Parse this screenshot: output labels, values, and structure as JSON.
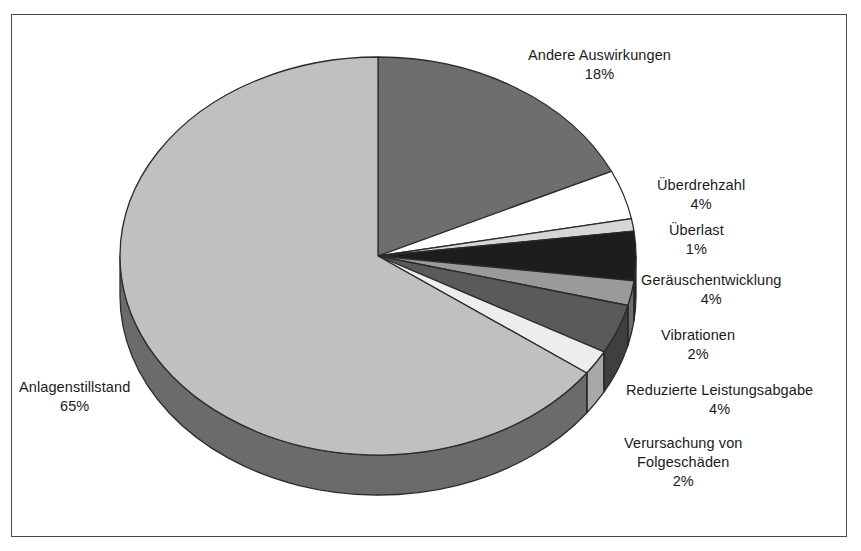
{
  "chart_data": {
    "type": "pie",
    "title": "",
    "subtitle": "",
    "xlabel": "",
    "ylabel": "",
    "legend_position": "callout-labels",
    "grid": false,
    "units": "%",
    "start_angle_deg": 0,
    "direction": "clockwise",
    "total": 100,
    "categories": [
      "Andere Auswirkungen",
      "Überdrehzahl",
      "Überlast",
      "Geräuschentwicklung",
      "Vibrationen",
      "Reduzierte Leistungsabgabe",
      "Verursachung von Folgeschäden",
      "Anlagenstillstand"
    ],
    "values": [
      18,
      4,
      1,
      4,
      2,
      4,
      2,
      65
    ],
    "labels": [
      "18%",
      "4%",
      "1%",
      "4%",
      "2%",
      "4%",
      "2%",
      "65%"
    ],
    "colors": [
      "#6e6e6e",
      "#ffffff",
      "#d6d6d6",
      "#1d1d1d",
      "#9a9a9a",
      "#5a5a5a",
      "#ededed",
      "#c0c0c0"
    ],
    "side_colors": [
      "#4d4d4d",
      "#b5b5b5",
      "#9a9a9a",
      "#121212",
      "#6e6e6e",
      "#3f3f3f",
      "#a8a8a8",
      "#6b6b6b"
    ],
    "slices": [
      {
        "name": "Andere Auswirkungen",
        "value": 18,
        "label": "18%",
        "color": "#6e6e6e"
      },
      {
        "name": "Überdrehzahl",
        "value": 4,
        "label": "4%",
        "color": "#ffffff"
      },
      {
        "name": "Überlast",
        "value": 1,
        "label": "1%",
        "color": "#d6d6d6"
      },
      {
        "name": "Geräuschentwicklung",
        "value": 4,
        "label": "4%",
        "color": "#1d1d1d"
      },
      {
        "name": "Vibrationen",
        "value": 2,
        "label": "2%",
        "color": "#9a9a9a"
      },
      {
        "name": "Reduzierte Leistungsabgabe",
        "value": 4,
        "label": "4%",
        "color": "#5a5a5a"
      },
      {
        "name": "Verursachung von Folgeschäden",
        "value": 2,
        "label": "2%",
        "color": "#ededed"
      },
      {
        "name": "Anlagenstillstand",
        "value": 65,
        "label": "65%",
        "color": "#c0c0c0"
      }
    ]
  },
  "callouts": {
    "andere_auswirkungen": {
      "name": "Andere Auswirkungen",
      "pct": "18%"
    },
    "ueberdrehzahl": {
      "name": "Überdrehzahl",
      "pct": "4%"
    },
    "ueberlast": {
      "name": "Überlast",
      "pct": "1%"
    },
    "geraeuschentwicklung": {
      "name": "Geräuschentwicklung",
      "pct": "4%"
    },
    "vibrationen": {
      "name": "Vibrationen",
      "pct": "2%"
    },
    "reduzierte_leistungsabgabe": {
      "name": "Reduzierte Leistungsabgabe",
      "pct": "4%"
    },
    "verursachung_folgeschaeden": {
      "name_line1": "Verursachung von",
      "name_line2": "Folgeschäden",
      "pct": "2%"
    },
    "anlagenstillstand": {
      "name": "Anlagenstillstand",
      "pct": "65%"
    }
  },
  "frame": {
    "border_color": "#4a4a4a",
    "background": "#ffffff"
  }
}
